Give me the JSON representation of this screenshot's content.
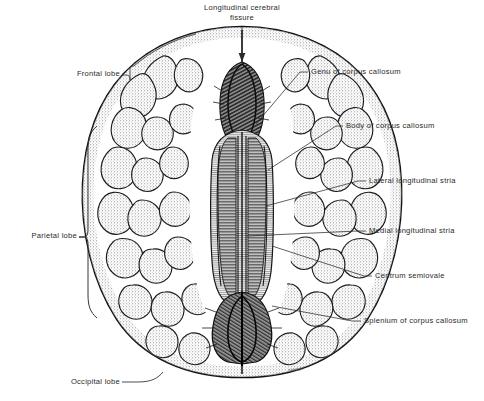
{
  "figure": {
    "title": "Longitudinal cerebral fissure",
    "view": "Axial (horizontal) section of cerebrum showing corpus callosum",
    "background_color": "#ffffff",
    "ink_color": "#1a1a1a",
    "text_color": "#2a2a2a",
    "cortex_fill": "#d8d8d8",
    "white_matter_fill": "#ffffff",
    "callosum_fill": "#9a9a9a",
    "signature": "Netter"
  },
  "labels": {
    "top": {
      "line1": "Longitudinal cerebral",
      "line2": "fissure"
    },
    "left": [
      {
        "id": "frontal-lobe",
        "text": "Frontal lobe",
        "leader": "bracket-small"
      },
      {
        "id": "parietal-lobe",
        "text": "Parietal lobe",
        "leader": "brace-large"
      },
      {
        "id": "occipital-lobe",
        "text": "Occipital lobe",
        "leader": "curve"
      }
    ],
    "right": [
      {
        "id": "genu-of-corpus-callosum",
        "text": "Genu of corpus callosum"
      },
      {
        "id": "body-of-corpus-callosum",
        "text": "Body of corpus callosum"
      },
      {
        "id": "lateral-longitudinal-stria",
        "text": "Lateral longitudinal stria"
      },
      {
        "id": "medial-longitudinal-stria",
        "text": "Medial longitudinal stria"
      },
      {
        "id": "centrum-semiovale",
        "text": "Centrum semiovale"
      },
      {
        "id": "splenium-of-corpus-callosum",
        "text": "Splenium of corpus callosum"
      }
    ]
  }
}
